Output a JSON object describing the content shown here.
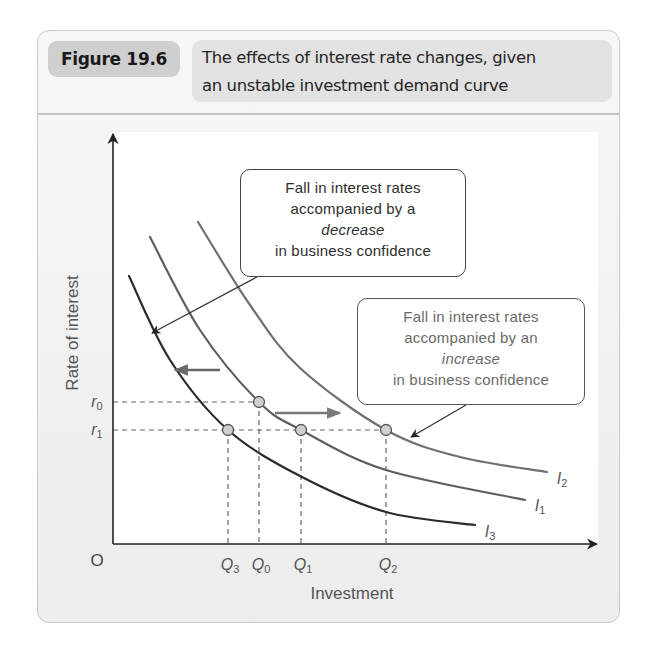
{
  "figure": {
    "label": "Figure 19.6",
    "title_line1": "The effects of interest rate changes, given",
    "title_line2": "an unstable investment demand curve"
  },
  "chart_data": {
    "type": "line",
    "title": "The effects of interest rate changes, given an unstable investment demand curve",
    "xlabel": "Investment",
    "ylabel": "Rate of interest",
    "origin_label": "O",
    "grid": false,
    "y_ticks": [
      {
        "label": "r",
        "sub": "0",
        "y_px": 402
      },
      {
        "label": "r",
        "sub": "1",
        "y_px": 430
      }
    ],
    "x_ticks": [
      {
        "label": "Q",
        "sub": "3",
        "x_px": 228
      },
      {
        "label": "Q",
        "sub": "0",
        "x_px": 259
      },
      {
        "label": "Q",
        "sub": "1",
        "x_px": 301
      },
      {
        "label": "Q",
        "sub": "2",
        "x_px": 386
      }
    ],
    "series": [
      {
        "name": "I3",
        "label": "I",
        "sub": "3",
        "color": "#2b2b2b",
        "width": 2.2,
        "points": [
          [
            129,
            276
          ],
          [
            170,
            360
          ],
          [
            228,
            430
          ],
          [
            302,
            477
          ],
          [
            386,
            512
          ],
          [
            475,
            525
          ]
        ],
        "label_pos": [
          490,
          532
        ]
      },
      {
        "name": "I1",
        "label": "I",
        "sub": "1",
        "color": "#5e5e5e",
        "width": 2.2,
        "points": [
          [
            150,
            237
          ],
          [
            200,
            330
          ],
          [
            259,
            402
          ],
          [
            301,
            430
          ],
          [
            386,
            470
          ],
          [
            525,
            500
          ]
        ],
        "label_pos": [
          540,
          506
        ]
      },
      {
        "name": "I2",
        "label": "I",
        "sub": "2",
        "color": "#707070",
        "width": 2.2,
        "points": [
          [
            198,
            222
          ],
          [
            250,
            305
          ],
          [
            300,
            368
          ],
          [
            386,
            430
          ],
          [
            460,
            457
          ],
          [
            547,
            472
          ]
        ],
        "label_pos": [
          562,
          479
        ]
      }
    ],
    "points": [
      {
        "name": "r0-Q0 on I1",
        "x": 259,
        "y": 402
      },
      {
        "name": "r1-Q3 on I3",
        "x": 228,
        "y": 430
      },
      {
        "name": "r1-Q1 on I1",
        "x": 301,
        "y": 430
      },
      {
        "name": "r1-Q2 on I2",
        "x": 386,
        "y": 430
      }
    ],
    "shift_arrows": [
      {
        "direction": "left",
        "from": [
          220,
          370
        ],
        "to": [
          175,
          370
        ],
        "color": "#666"
      },
      {
        "direction": "right",
        "from": [
          275,
          413
        ],
        "to": [
          340,
          413
        ],
        "color": "#777"
      }
    ],
    "annotations": [
      {
        "id": "decrease",
        "lines": [
          "Fall in interest rates",
          "accompanied by a",
          "decrease",
          "in business confidence"
        ],
        "italic_line": 2,
        "pointer_from": [
          257,
          277
        ],
        "pointer_to": [
          152,
          333
        ]
      },
      {
        "id": "increase",
        "lines": [
          "Fall in interest rates",
          "accompanied by an",
          "increase",
          "in business confidence"
        ],
        "italic_line": 2,
        "pointer_from": [
          466,
          405
        ],
        "pointer_to": [
          411,
          437
        ]
      }
    ]
  }
}
